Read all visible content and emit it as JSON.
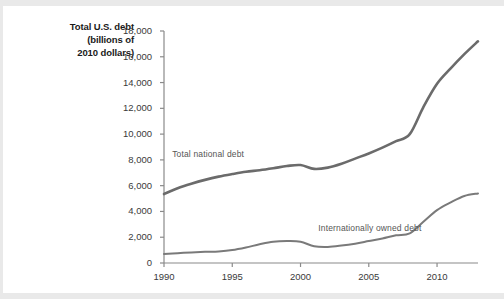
{
  "axis_title": {
    "line1": "Total U.S. debt",
    "line2": "(billions of",
    "line3": "2010 dollars)"
  },
  "colors": {
    "line_total": "#6b6b6b",
    "line_international": "#7a7a7a",
    "axis": "#8a8a8a",
    "tick_text": "#3a3a3a",
    "label_text": "#555555",
    "background": "#ffffff",
    "band": "#e9e9e9"
  },
  "chart_data": {
    "type": "line",
    "title": "",
    "subtitle": "",
    "xlabel": "",
    "ylabel": "Total U.S. debt (billions of 2010 dollars)",
    "xlim": [
      1990,
      2013
    ],
    "ylim": [
      0,
      18000
    ],
    "grid": false,
    "legend_position": "inline-annotations",
    "x_ticks": [
      1990,
      1995,
      2000,
      2005,
      2010
    ],
    "x_tick_labels": [
      "1990",
      "1995",
      "2000",
      "2005",
      "2010"
    ],
    "y_ticks": [
      0,
      2000,
      4000,
      6000,
      8000,
      10000,
      12000,
      14000,
      16000,
      18000
    ],
    "y_tick_labels": [
      "0",
      "2,000",
      "4,000",
      "6,000",
      "8,000",
      "10,000",
      "12,000",
      "14,000",
      "16,000",
      "18,000"
    ],
    "x": [
      1990,
      1991,
      1992,
      1993,
      1994,
      1995,
      1996,
      1997,
      1998,
      1999,
      2000,
      2001,
      2002,
      2003,
      2004,
      2005,
      2006,
      2007,
      2008,
      2009,
      2010,
      2011,
      2012,
      2013
    ],
    "series": [
      {
        "name": "Total national debt",
        "label": "Total national debt",
        "color": "#6b6b6b",
        "width": 2.6,
        "label_x": 1990.6,
        "label_y": 8450,
        "values": [
          5350,
          5800,
          6150,
          6450,
          6700,
          6900,
          7080,
          7200,
          7350,
          7520,
          7600,
          7300,
          7400,
          7700,
          8100,
          8500,
          8950,
          9450,
          10000,
          12100,
          13900,
          15100,
          16200,
          17200
        ]
      },
      {
        "name": "Internationally owned debt",
        "label": "Internationally owned debt",
        "color": "#7a7a7a",
        "width": 2.0,
        "label_x": 2001.3,
        "label_y": 2700,
        "values": [
          700,
          760,
          820,
          870,
          900,
          1000,
          1200,
          1450,
          1650,
          1700,
          1650,
          1300,
          1250,
          1350,
          1500,
          1700,
          1900,
          2150,
          2300,
          3200,
          4100,
          4700,
          5200,
          5400
        ]
      }
    ]
  }
}
